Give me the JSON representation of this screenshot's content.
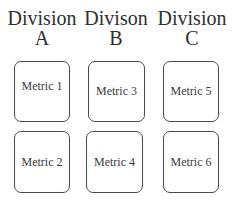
{
  "divisions": [
    {
      "title": "Division",
      "letter": "A",
      "metrics": [
        "Metric 1",
        "Metric 2"
      ]
    },
    {
      "title": "Divison",
      "letter": "B",
      "metrics": [
        "Metric 3",
        "Metric 4"
      ]
    },
    {
      "title": "Division",
      "letter": "C",
      "metrics": [
        "Metric 5",
        "Metric 6"
      ]
    }
  ]
}
